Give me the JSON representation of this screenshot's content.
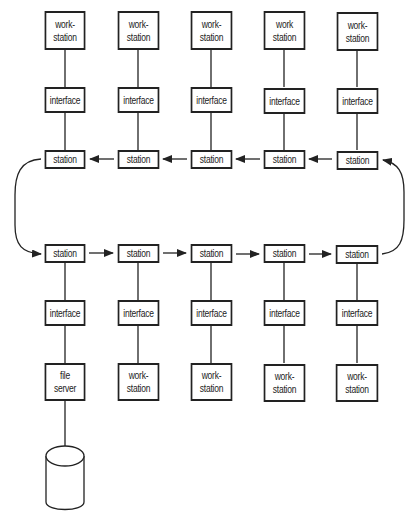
{
  "diagram": {
    "type": "token-ring network",
    "top_row": {
      "workstations": [
        "work-\nstation",
        "work-\nstation",
        "work-\nstation",
        "work\nstation",
        "work-\nstation"
      ],
      "interfaces": [
        "interface",
        "interface",
        "interface",
        "interface",
        "interface"
      ],
      "stations": [
        "station",
        "station",
        "station",
        "station",
        "station"
      ],
      "flow_direction": "right-to-left"
    },
    "bottom_row": {
      "stations": [
        "station",
        "station",
        "station",
        "station",
        "station"
      ],
      "interfaces": [
        "interface",
        "interface",
        "interface",
        "interface",
        "interface"
      ],
      "devices": [
        "file\nserver",
        "work-\nstation",
        "work-\nstation",
        "work-\nstation",
        "work-\nstation"
      ],
      "flow_direction": "left-to-right"
    },
    "storage": "disk-cylinder",
    "colors": {
      "line": "#222222",
      "background": "#ffffff"
    }
  }
}
